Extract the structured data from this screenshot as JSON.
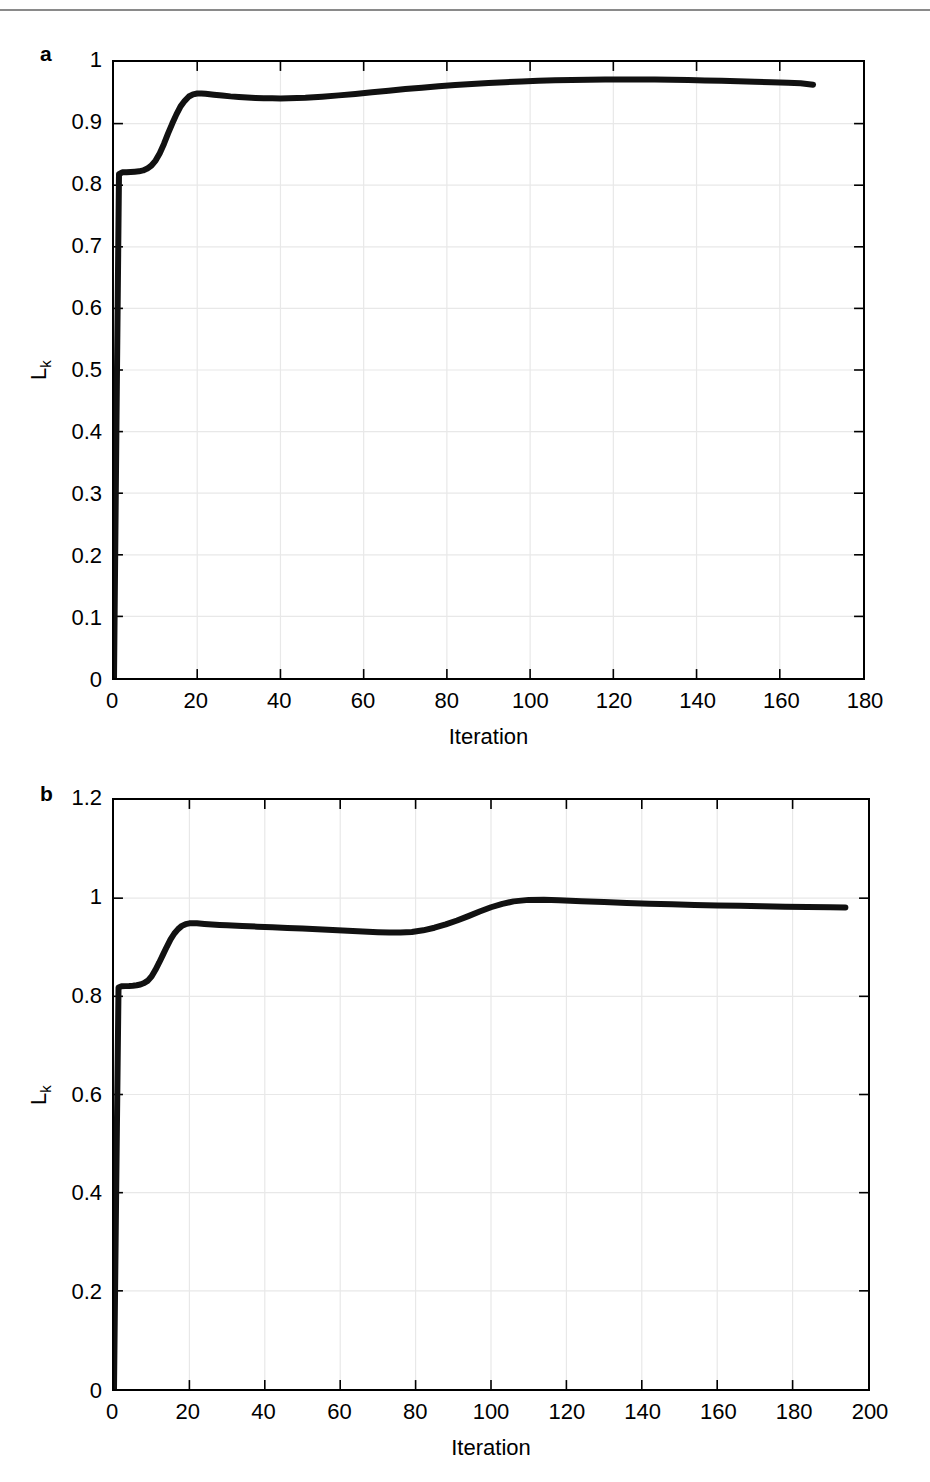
{
  "figure": {
    "background": "#ffffff",
    "line_color": "#111111",
    "grid_color": "#e8e8e8",
    "axis_color": "#000000",
    "top_rule_color": "#8a8a8a"
  },
  "panels": {
    "a": {
      "letter": "a",
      "y_axis_title_main": "L",
      "y_axis_title_sub": "k",
      "x_axis_title": "Iteration"
    },
    "b": {
      "letter": "b",
      "y_axis_title_main": "L",
      "y_axis_title_sub": "k",
      "x_axis_title": "Iteration"
    }
  },
  "chart_data": [
    {
      "type": "line",
      "panel": "a",
      "title": "",
      "xlabel": "Iteration",
      "ylabel": "L_k",
      "xlim": [
        0,
        180
      ],
      "ylim": [
        0,
        1
      ],
      "grid": true,
      "legend": "none",
      "xticks": [
        0,
        20,
        40,
        60,
        80,
        100,
        120,
        140,
        160,
        180
      ],
      "xtick_labels": [
        "0",
        "20",
        "40",
        "60",
        "80",
        "100",
        "120",
        "140",
        "160",
        "180"
      ],
      "yticks": [
        0,
        0.1,
        0.2,
        0.3,
        0.4,
        0.5,
        0.6,
        0.7,
        0.8,
        0.9,
        1
      ],
      "ytick_labels": [
        "0",
        "0.1",
        "0.2",
        "0.3",
        "0.4",
        "0.5",
        "0.6",
        "0.7",
        "0.8",
        "0.9",
        "1"
      ],
      "series": [
        {
          "name": "Lk",
          "x": [
            0,
            0.6,
            1.2,
            2,
            3,
            4,
            5,
            6,
            7,
            8,
            9,
            10,
            11,
            12,
            13,
            14,
            15,
            16,
            17,
            18,
            19,
            20,
            21,
            22,
            24,
            26,
            28,
            30,
            32,
            34,
            36,
            38,
            40,
            42,
            44,
            46,
            48,
            50,
            54,
            58,
            62,
            66,
            70,
            74,
            78,
            82,
            86,
            90,
            94,
            98,
            102,
            106,
            110,
            114,
            118,
            122,
            126,
            130,
            134,
            138,
            142,
            146,
            150,
            154,
            158,
            162,
            165,
            168
          ],
          "y": [
            0,
            0.42,
            0.818,
            0.821,
            0.821,
            0.8215,
            0.822,
            0.8225,
            0.824,
            0.827,
            0.832,
            0.84,
            0.852,
            0.867,
            0.884,
            0.9,
            0.915,
            0.928,
            0.937,
            0.944,
            0.9475,
            0.9488,
            0.949,
            0.9485,
            0.947,
            0.9455,
            0.9442,
            0.9432,
            0.9423,
            0.9417,
            0.9412,
            0.941,
            0.9409,
            0.9411,
            0.9415,
            0.942,
            0.9428,
            0.9437,
            0.9458,
            0.9482,
            0.9508,
            0.9535,
            0.956,
            0.9583,
            0.9605,
            0.9625,
            0.9643,
            0.966,
            0.9673,
            0.9685,
            0.9695,
            0.9703,
            0.9709,
            0.9713,
            0.9716,
            0.9717,
            0.9717,
            0.9715,
            0.9712,
            0.9707,
            0.9701,
            0.9694,
            0.9686,
            0.9678,
            0.967,
            0.9662,
            0.9656,
            0.9632
          ]
        }
      ]
    },
    {
      "type": "line",
      "panel": "b",
      "title": "",
      "xlabel": "Iteration",
      "ylabel": "L_k",
      "xlim": [
        0,
        200
      ],
      "ylim": [
        0,
        1.2
      ],
      "grid": true,
      "legend": "none",
      "xticks": [
        0,
        20,
        40,
        60,
        80,
        100,
        120,
        140,
        160,
        180,
        200
      ],
      "xtick_labels": [
        "0",
        "20",
        "40",
        "60",
        "80",
        "100",
        "120",
        "140",
        "160",
        "180",
        "200"
      ],
      "yticks": [
        0,
        0.2,
        0.4,
        0.6,
        0.8,
        1,
        1.2
      ],
      "ytick_labels": [
        "0",
        "0.2",
        "0.4",
        "0.6",
        "0.8",
        "1",
        "1.2"
      ],
      "series": [
        {
          "name": "Lk",
          "x": [
            0,
            0.6,
            1.2,
            2,
            3,
            4,
            5,
            6,
            7,
            8,
            9,
            10,
            11,
            12,
            13,
            14,
            15,
            16,
            17,
            18,
            19,
            20,
            21,
            22,
            24,
            26,
            28,
            30,
            34,
            38,
            42,
            46,
            50,
            54,
            58,
            62,
            66,
            70,
            73,
            76,
            79,
            82,
            85,
            88,
            91,
            94,
            97,
            100,
            103,
            106,
            110,
            114,
            118,
            124,
            130,
            136,
            142,
            148,
            154,
            160,
            166,
            172,
            178,
            184,
            190,
            194
          ],
          "y": [
            0,
            0.42,
            0.818,
            0.8205,
            0.8208,
            0.821,
            0.8215,
            0.8225,
            0.824,
            0.827,
            0.832,
            0.841,
            0.854,
            0.869,
            0.885,
            0.901,
            0.916,
            0.928,
            0.937,
            0.9435,
            0.947,
            0.9487,
            0.949,
            0.9487,
            0.9475,
            0.9465,
            0.9455,
            0.9447,
            0.9432,
            0.942,
            0.9407,
            0.9393,
            0.938,
            0.9365,
            0.935,
            0.9335,
            0.932,
            0.9305,
            0.9298,
            0.9298,
            0.9312,
            0.9345,
            0.9398,
            0.9465,
            0.9545,
            0.9635,
            0.9728,
            0.9815,
            0.9885,
            0.9935,
            0.9965,
            0.9968,
            0.9958,
            0.9938,
            0.992,
            0.9903,
            0.9888,
            0.9875,
            0.9863,
            0.9852,
            0.9843,
            0.9835,
            0.9827,
            0.9821,
            0.9815,
            0.9812
          ]
        }
      ]
    }
  ]
}
